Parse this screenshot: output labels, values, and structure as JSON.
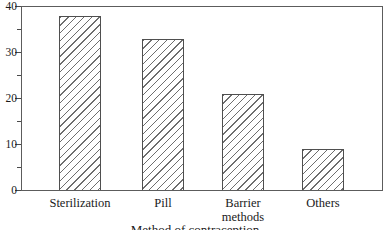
{
  "chart_data": {
    "type": "bar",
    "categories": [
      "Sterilization",
      "Pill",
      "Barrier methods",
      "Others"
    ],
    "values": [
      38,
      33,
      21,
      9
    ],
    "title": "",
    "xlabel": "Method of contraception",
    "ylabel": "",
    "ylim": [
      0,
      40
    ],
    "yticks": [
      0,
      10,
      20,
      30,
      40
    ],
    "ytick_labels": [
      "0",
      "10",
      "20",
      "30",
      "40"
    ],
    "minor_ytick_step": 5,
    "grid": false,
    "legend": "none",
    "frame": "full-box",
    "bar_fill": "white-with-diagonal-hatch",
    "hatch_direction": "/"
  },
  "colors": {
    "background": "#ffffff",
    "frame": "#5c5c5c",
    "bar_border": "#4f4f4f",
    "hatch_line": "#6e6e6e",
    "tick": "#4a4a4a",
    "text": "#1a1a1a"
  }
}
